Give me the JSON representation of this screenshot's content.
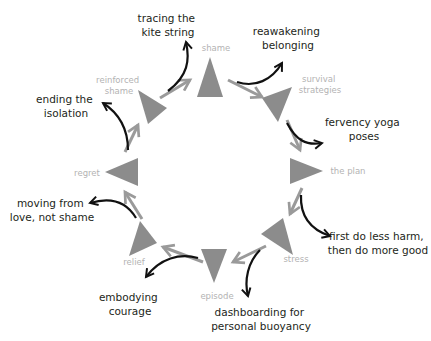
{
  "diagram": {
    "type": "cycle",
    "colors": {
      "triangle": "#8c8c8c",
      "cycle_arrow": "#9a9a9a",
      "intervention_arrow": "#111111",
      "node_label": "#b3b3b3",
      "intervention_label": "#231f20"
    },
    "nodes": [
      {
        "id": "shame",
        "label_lines": [
          "shame"
        ]
      },
      {
        "id": "survival-strategies",
        "label_lines": [
          "survival",
          "strategies"
        ]
      },
      {
        "id": "the-plan",
        "label_lines": [
          "the plan"
        ]
      },
      {
        "id": "stress",
        "label_lines": [
          "stress"
        ]
      },
      {
        "id": "episode",
        "label_lines": [
          "episode"
        ]
      },
      {
        "id": "relief",
        "label_lines": [
          "relief"
        ]
      },
      {
        "id": "regret",
        "label_lines": [
          "regret"
        ]
      },
      {
        "id": "reinforced-shame",
        "label_lines": [
          "reinforced",
          "shame"
        ]
      }
    ],
    "interventions": [
      {
        "id": "reawakening-belonging",
        "label_lines": [
          "reawakening",
          "belonging"
        ]
      },
      {
        "id": "fervency-yoga-poses",
        "label_lines": [
          "fervency yoga",
          "poses"
        ]
      },
      {
        "id": "first-do-less-harm",
        "label_lines": [
          "first do less harm,",
          "then do more good"
        ]
      },
      {
        "id": "dashboarding",
        "label_lines": [
          "dashboarding for",
          "personal buoyancy"
        ]
      },
      {
        "id": "embodying-courage",
        "label_lines": [
          "embodying",
          "courage"
        ]
      },
      {
        "id": "moving-from-love",
        "label_lines": [
          "moving from",
          "love, not shame"
        ]
      },
      {
        "id": "ending-the-isolation",
        "label_lines": [
          "ending the",
          "isolation"
        ]
      },
      {
        "id": "tracing-the-kite-string",
        "label_lines": [
          "tracing the",
          "kite string"
        ]
      }
    ]
  }
}
